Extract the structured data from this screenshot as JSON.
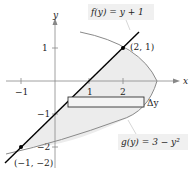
{
  "diagram": {
    "type": "region-between-curves",
    "axes": {
      "x_label": "x",
      "y_label": "y",
      "x_ticks": [
        {
          "value": -1,
          "label": "−1"
        },
        {
          "value": 1,
          "label": "1"
        },
        {
          "value": 2,
          "label": "2"
        }
      ],
      "y_ticks": [
        {
          "value": 1,
          "label": "1"
        },
        {
          "value": -1,
          "label": "−1"
        },
        {
          "value": -2,
          "label": "−2"
        }
      ]
    },
    "curves": {
      "f": {
        "label": "f(y) = y + 1",
        "color": "#000000"
      },
      "g": {
        "label": "g(y) = 3 − y²",
        "color": "#8a8a8a"
      }
    },
    "points": [
      {
        "label": "(2, 1)",
        "x": 2,
        "y": 1
      },
      {
        "label": "(−1, −2)",
        "x": -1,
        "y": -2
      }
    ],
    "representative_rectangle": {
      "label": "Δy"
    },
    "shading_color": "#ececec"
  }
}
